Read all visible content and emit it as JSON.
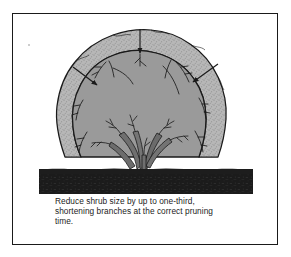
{
  "figure": {
    "kind": "pruning-diagram",
    "title_visible": false,
    "frame": {
      "border_color": "#1a1a1a",
      "background_color": "#ffffff"
    },
    "colors": {
      "outer_canopy_fill": "#b5b5b5",
      "outer_canopy_stipple": "#8f8f8f",
      "inner_canopy_fill": "#9a9a9a",
      "outline": "#1a1a1a",
      "soil_band": "#1d1d1d",
      "branch_fill": "#6f6f6f",
      "arrow_color": "#1a1a1a",
      "page_background": "#ffffff"
    },
    "regions": [
      {
        "name": "outer-canopy",
        "label": "original shrub size before pruning",
        "shading": "stippled light gray"
      },
      {
        "name": "inner-canopy",
        "label": "reduced shrub size after pruning",
        "shading": "solid mid gray"
      },
      {
        "name": "soil-band",
        "label": "ground / soil",
        "shading": "solid near-black"
      },
      {
        "name": "shrub-stems",
        "label": "multi-stemmed shrub base with branches",
        "stem_count": 6
      }
    ],
    "arrows": [
      {
        "name": "arrow-top",
        "direction": "down",
        "meaning": "reduce height inward"
      },
      {
        "name": "arrow-left",
        "direction": "down-right",
        "meaning": "reduce width inward from left"
      },
      {
        "name": "arrow-right",
        "direction": "down-left",
        "meaning": "reduce width inward from right"
      }
    ]
  },
  "caption": {
    "lines": [
      "Reduce shrub size by up to one-third,",
      "shortening branches at the correct pruning",
      "time."
    ],
    "line1": "Reduce shrub size by up to one-third,",
    "line2": "shortening branches at the correct pruning",
    "line3": "time.",
    "full_text": "Reduce shrub size by up to one-third, shortening branches at the correct pruning time."
  }
}
